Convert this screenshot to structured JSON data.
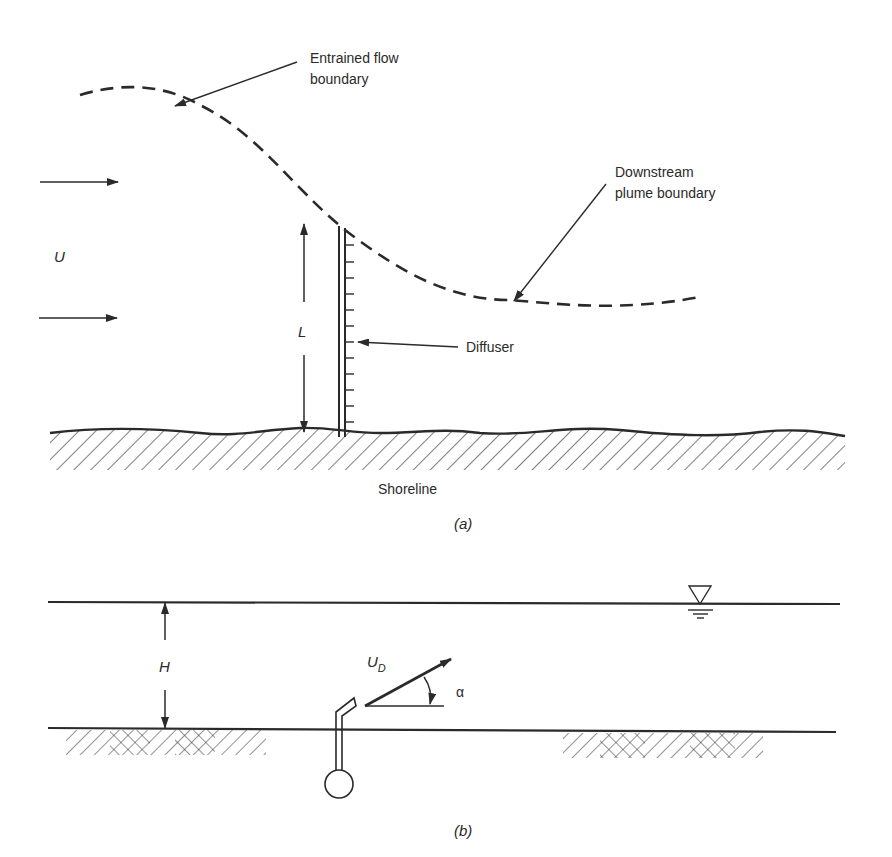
{
  "figure_a": {
    "caption": "(a)",
    "labels": {
      "entrained_line1": "Entrained flow",
      "entrained_line2": "boundary",
      "downstream_line1": "Downstream",
      "downstream_line2": "plume boundary",
      "velocity": "U",
      "length": "L",
      "diffuser": "Diffuser",
      "shoreline": "Shoreline"
    }
  },
  "figure_b": {
    "caption": "(b)",
    "labels": {
      "depth": "H",
      "jet_velocity_main": "U",
      "jet_velocity_sub": "D",
      "angle": "α"
    },
    "water_surface_symbol": "triangle-water-level-icon"
  },
  "colors": {
    "ink": "#2a2a2a",
    "background": "#ffffff"
  }
}
